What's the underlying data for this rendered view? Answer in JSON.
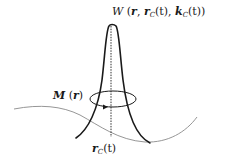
{
  "figure": {
    "colors": {
      "curve": "#1a1a1a",
      "trajectory": "#8a8a8a",
      "background": "#ffffff"
    },
    "labels": {
      "wavepacket": {
        "symbol": "W",
        "open": " (",
        "arg1": "r",
        "sep1": ", ",
        "arg2_base": "r",
        "arg2_sub": "C",
        "arg2_tail": "(t)",
        "sep2": ", ",
        "arg3_base": "k",
        "arg3_sub": "C",
        "arg3_tail": "(t)",
        "close": ")"
      },
      "ring": {
        "symbol": "M",
        "open": " (",
        "arg": "r",
        "close": ")"
      },
      "center": {
        "base": "r",
        "sub": "C",
        "tail": "(t)"
      }
    }
  }
}
